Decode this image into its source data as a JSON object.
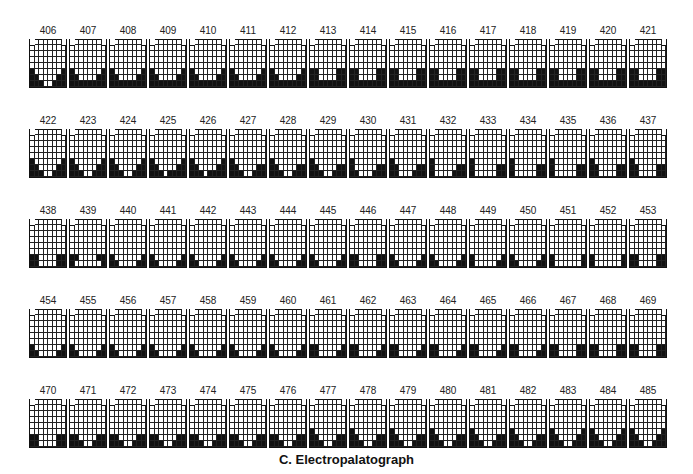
{
  "figure": {
    "caption": "C. Electropalatograph",
    "grid_shape": {
      "rows": 8,
      "cols": 8,
      "row0_cols": "1-6"
    },
    "frames": [
      {
        "id": "406",
        "p": [
          "000000",
          "00000000",
          "00000000",
          "00000000",
          "00000000",
          "10000001",
          "11000011",
          "11100111"
        ]
      },
      {
        "id": "407",
        "p": [
          "000000",
          "00000000",
          "00000000",
          "00000000",
          "00000000",
          "10000001",
          "11000011",
          "11111111"
        ]
      },
      {
        "id": "408",
        "p": [
          "000000",
          "00000000",
          "00000000",
          "00000000",
          "00000000",
          "10000001",
          "11000011",
          "11111111"
        ]
      },
      {
        "id": "409",
        "p": [
          "000000",
          "00000000",
          "00000000",
          "00000000",
          "00000000",
          "10000001",
          "11000011",
          "11111111"
        ]
      },
      {
        "id": "410",
        "p": [
          "000000",
          "00000000",
          "00000000",
          "00000000",
          "00000000",
          "10000001",
          "11000011",
          "11111111"
        ]
      },
      {
        "id": "411",
        "p": [
          "000000",
          "00000000",
          "00000000",
          "00000000",
          "00000000",
          "10000001",
          "11000011",
          "11111111"
        ]
      },
      {
        "id": "412",
        "p": [
          "000000",
          "00000000",
          "00000000",
          "00000000",
          "00000000",
          "10000001",
          "11000011",
          "11111111"
        ]
      },
      {
        "id": "413",
        "p": [
          "000000",
          "00000000",
          "00000000",
          "00000000",
          "00000000",
          "11000011",
          "11000011",
          "11111111"
        ]
      },
      {
        "id": "414",
        "p": [
          "000000",
          "00000000",
          "00000000",
          "00000000",
          "00000000",
          "11000011",
          "11000011",
          "11111111"
        ]
      },
      {
        "id": "415",
        "p": [
          "000000",
          "00000000",
          "00000000",
          "00000000",
          "00000000",
          "11000011",
          "11000011",
          "11111111"
        ]
      },
      {
        "id": "416",
        "p": [
          "000000",
          "00000000",
          "00000000",
          "00000000",
          "00000000",
          "11000011",
          "11000011",
          "11111111"
        ]
      },
      {
        "id": "417",
        "p": [
          "000000",
          "00000000",
          "00000000",
          "00000000",
          "00000000",
          "11000011",
          "11000011",
          "11111111"
        ]
      },
      {
        "id": "418",
        "p": [
          "000000",
          "00000000",
          "00000000",
          "00000000",
          "00000000",
          "11000011",
          "11000011",
          "11111111"
        ]
      },
      {
        "id": "419",
        "p": [
          "000000",
          "00000000",
          "00000000",
          "00000000",
          "00000000",
          "11000011",
          "11000011",
          "11111111"
        ]
      },
      {
        "id": "420",
        "p": [
          "000000",
          "00000000",
          "00000000",
          "00000000",
          "00000000",
          "11000011",
          "11000011",
          "11111111"
        ]
      },
      {
        "id": "421",
        "p": [
          "000000",
          "00000000",
          "00000000",
          "00000000",
          "00000000",
          "11000011",
          "11000011",
          "11111111"
        ]
      },
      {
        "id": "422",
        "p": [
          "000000",
          "00000000",
          "00000000",
          "00000000",
          "00000000",
          "10000001",
          "11000011",
          "11100111"
        ]
      },
      {
        "id": "423",
        "p": [
          "000000",
          "00000000",
          "00000000",
          "00000000",
          "00000000",
          "10000001",
          "11000011",
          "11100111"
        ]
      },
      {
        "id": "424",
        "p": [
          "000000",
          "00000000",
          "00000000",
          "00000000",
          "00000000",
          "10000001",
          "11000011",
          "11100111"
        ]
      },
      {
        "id": "425",
        "p": [
          "000000",
          "00000000",
          "00000000",
          "00000000",
          "00000000",
          "10000001",
          "11000011",
          "11101111"
        ]
      },
      {
        "id": "426",
        "p": [
          "000000",
          "00000000",
          "00000000",
          "00000000",
          "00000000",
          "10000001",
          "11000011",
          "11101111"
        ]
      },
      {
        "id": "427",
        "p": [
          "000000",
          "00000000",
          "00000000",
          "00000000",
          "00000000",
          "10000000",
          "11000011",
          "11100111"
        ]
      },
      {
        "id": "428",
        "p": [
          "000000",
          "00000000",
          "00000000",
          "00000000",
          "00000000",
          "10000000",
          "11000011",
          "11100111"
        ]
      },
      {
        "id": "429",
        "p": [
          "000000",
          "00000000",
          "00000000",
          "00000000",
          "00000000",
          "10000000",
          "11000011",
          "11100111"
        ]
      },
      {
        "id": "430",
        "p": [
          "000000",
          "00000000",
          "00000000",
          "00000000",
          "00000000",
          "10000000",
          "10000011",
          "11000111"
        ]
      },
      {
        "id": "431",
        "p": [
          "000000",
          "00000000",
          "00000000",
          "00000000",
          "00000000",
          "10000000",
          "11000011",
          "11000111"
        ]
      },
      {
        "id": "432",
        "p": [
          "000000",
          "00000000",
          "00000000",
          "00000000",
          "00000000",
          "10000000",
          "10000011",
          "10000111"
        ]
      },
      {
        "id": "433",
        "p": [
          "000000",
          "00000000",
          "00000000",
          "00000000",
          "00000000",
          "10000000",
          "10000011",
          "10000011"
        ]
      },
      {
        "id": "434",
        "p": [
          "000000",
          "00000000",
          "00000000",
          "00000000",
          "00000000",
          "10000000",
          "10000011",
          "10000011"
        ]
      },
      {
        "id": "435",
        "p": [
          "000000",
          "00000000",
          "00000000",
          "00000000",
          "00000000",
          "10000000",
          "10000011",
          "10000011"
        ]
      },
      {
        "id": "436",
        "p": [
          "000000",
          "00000000",
          "00000000",
          "00000000",
          "00000000",
          "10000000",
          "11000011",
          "11000011"
        ]
      },
      {
        "id": "437",
        "p": [
          "000000",
          "00000000",
          "00000000",
          "00000000",
          "00000000",
          "10000000",
          "11000011",
          "11000011"
        ]
      },
      {
        "id": "438",
        "p": [
          "000000",
          "00000000",
          "00000000",
          "00000000",
          "00000000",
          "00000000",
          "11000011",
          "11000011"
        ]
      },
      {
        "id": "439",
        "p": [
          "000000",
          "00000000",
          "00000000",
          "00000000",
          "00000000",
          "00000000",
          "11000011",
          "10000001"
        ]
      },
      {
        "id": "440",
        "p": [
          "000000",
          "00000000",
          "00000000",
          "00000000",
          "00000000",
          "00000000",
          "10000001",
          "11000011"
        ]
      },
      {
        "id": "441",
        "p": [
          "000000",
          "00000000",
          "00000000",
          "00000000",
          "00000000",
          "00000000",
          "10000001",
          "11000011"
        ]
      },
      {
        "id": "442",
        "p": [
          "000000",
          "00000000",
          "00000000",
          "00000000",
          "00000000",
          "00000000",
          "10000001",
          "11000011"
        ]
      },
      {
        "id": "443",
        "p": [
          "000000",
          "00000000",
          "00000000",
          "00000000",
          "00000000",
          "00000000",
          "10000001",
          "11000011"
        ]
      },
      {
        "id": "444",
        "p": [
          "000000",
          "00000000",
          "00000000",
          "00000000",
          "00000000",
          "00000000",
          "10000001",
          "11000011"
        ]
      },
      {
        "id": "445",
        "p": [
          "000000",
          "00000000",
          "00000000",
          "00000000",
          "00000000",
          "00000000",
          "10000001",
          "11000011"
        ]
      },
      {
        "id": "446",
        "p": [
          "000000",
          "00000000",
          "00000000",
          "00000000",
          "00000000",
          "00000000",
          "11000011",
          "11000011"
        ]
      },
      {
        "id": "447",
        "p": [
          "000000",
          "00000000",
          "00000000",
          "00000000",
          "00000000",
          "00000000",
          "10000001",
          "11000011"
        ]
      },
      {
        "id": "448",
        "p": [
          "000000",
          "00000000",
          "00000000",
          "00000000",
          "00000000",
          "00000000",
          "10000001",
          "11000011"
        ]
      },
      {
        "id": "449",
        "p": [
          "000000",
          "00000000",
          "00000000",
          "00000000",
          "00000000",
          "00000000",
          "10000001",
          "10000011"
        ]
      },
      {
        "id": "450",
        "p": [
          "000000",
          "00000000",
          "00000000",
          "00000000",
          "00000000",
          "00000000",
          "10000001",
          "11000011"
        ]
      },
      {
        "id": "451",
        "p": [
          "000000",
          "00000000",
          "00000000",
          "00000000",
          "00000000",
          "00000000",
          "10000001",
          "10000001"
        ]
      },
      {
        "id": "452",
        "p": [
          "000000",
          "00000000",
          "00000000",
          "00000000",
          "00000000",
          "00000000",
          "10000001",
          "10000001"
        ]
      },
      {
        "id": "453",
        "p": [
          "000000",
          "00000000",
          "00000000",
          "00000000",
          "00000000",
          "00000000",
          "11000011",
          "11000011"
        ]
      },
      {
        "id": "454",
        "p": [
          "000000",
          "00000000",
          "00000000",
          "00000000",
          "00000000",
          "00000000",
          "10000001",
          "11000011"
        ]
      },
      {
        "id": "455",
        "p": [
          "000000",
          "00000000",
          "00000000",
          "00000000",
          "00000000",
          "00000000",
          "10000001",
          "11000011"
        ]
      },
      {
        "id": "456",
        "p": [
          "000000",
          "00000000",
          "00000000",
          "00000000",
          "00000000",
          "00000000",
          "10000001",
          "11000011"
        ]
      },
      {
        "id": "457",
        "p": [
          "000000",
          "00000000",
          "00000000",
          "00000000",
          "00000000",
          "00000000",
          "10000001",
          "11000011"
        ]
      },
      {
        "id": "458",
        "p": [
          "000000",
          "00000000",
          "00000000",
          "00000000",
          "00000000",
          "00000000",
          "10000001",
          "11000011"
        ]
      },
      {
        "id": "459",
        "p": [
          "000000",
          "00000000",
          "00000000",
          "00000000",
          "00000000",
          "00000000",
          "10000001",
          "11000011"
        ]
      },
      {
        "id": "460",
        "p": [
          "000000",
          "00000000",
          "00000000",
          "00000000",
          "00000000",
          "00000000",
          "10000001",
          "11000011"
        ]
      },
      {
        "id": "461",
        "p": [
          "000000",
          "00000000",
          "00000000",
          "00000000",
          "00000000",
          "00000000",
          "11000001",
          "11000011"
        ]
      },
      {
        "id": "462",
        "p": [
          "000000",
          "00000000",
          "00000000",
          "00000000",
          "00000000",
          "00000000",
          "11000001",
          "11000011"
        ]
      },
      {
        "id": "463",
        "p": [
          "000000",
          "00000000",
          "00000000",
          "00000000",
          "00000000",
          "00000000",
          "11000001",
          "11000011"
        ]
      },
      {
        "id": "464",
        "p": [
          "000000",
          "00000000",
          "00000000",
          "00000000",
          "00000000",
          "00000000",
          "11000001",
          "11000011"
        ]
      },
      {
        "id": "465",
        "p": [
          "000000",
          "00000000",
          "00000000",
          "00000000",
          "00000000",
          "00000000",
          "11000001",
          "11000011"
        ]
      },
      {
        "id": "466",
        "p": [
          "000000",
          "00000000",
          "00000000",
          "00000000",
          "00000000",
          "00000000",
          "11000001",
          "11000011"
        ]
      },
      {
        "id": "467",
        "p": [
          "000000",
          "00000000",
          "00000000",
          "00000000",
          "00000000",
          "00000000",
          "11000011",
          "11000011"
        ]
      },
      {
        "id": "468",
        "p": [
          "000000",
          "00000000",
          "00000000",
          "00000000",
          "00000000",
          "00000000",
          "11000011",
          "11000011"
        ]
      },
      {
        "id": "469",
        "p": [
          "000000",
          "00000000",
          "00000000",
          "00000000",
          "00000000",
          "00000000",
          "11000011",
          "11000011"
        ]
      },
      {
        "id": "470",
        "p": [
          "000000",
          "00000000",
          "00000000",
          "00000000",
          "00000000",
          "00000000",
          "11000011",
          "11000011"
        ]
      },
      {
        "id": "471",
        "p": [
          "000000",
          "00000000",
          "00000000",
          "00000000",
          "00000000",
          "00000000",
          "11000011",
          "11100111"
        ]
      },
      {
        "id": "472",
        "p": [
          "000000",
          "00000000",
          "00000000",
          "00000000",
          "00000000",
          "00000000",
          "11000011",
          "11100111"
        ]
      },
      {
        "id": "473",
        "p": [
          "000000",
          "00000000",
          "00000000",
          "00000000",
          "00000000",
          "00000000",
          "11000011",
          "11100111"
        ]
      },
      {
        "id": "474",
        "p": [
          "000000",
          "00000000",
          "00000000",
          "00000000",
          "00000000",
          "00000000",
          "11000011",
          "11100111"
        ]
      },
      {
        "id": "475",
        "p": [
          "000000",
          "00000000",
          "00000000",
          "00000000",
          "00000000",
          "00000000",
          "11000011",
          "11100111"
        ]
      },
      {
        "id": "476",
        "p": [
          "000000",
          "00000000",
          "00000000",
          "00000000",
          "00000000",
          "00000000",
          "11000011",
          "11100111"
        ]
      },
      {
        "id": "477",
        "p": [
          "000000",
          "00000000",
          "00000000",
          "00000000",
          "00000000",
          "10000000",
          "11000011",
          "11100111"
        ]
      },
      {
        "id": "478",
        "p": [
          "000000",
          "00000000",
          "00000000",
          "00000000",
          "00000000",
          "10000000",
          "11000011",
          "11100111"
        ]
      },
      {
        "id": "479",
        "p": [
          "000000",
          "00000000",
          "00000000",
          "00000000",
          "00000000",
          "10000000",
          "11000011",
          "11100111"
        ]
      },
      {
        "id": "480",
        "p": [
          "000000",
          "00000000",
          "00000000",
          "00000000",
          "00000000",
          "10000000",
          "11000011",
          "11100111"
        ]
      },
      {
        "id": "481",
        "p": [
          "000000",
          "00000000",
          "00000000",
          "00000000",
          "00000000",
          "10000000",
          "11000011",
          "11100111"
        ]
      },
      {
        "id": "482",
        "p": [
          "000000",
          "00000000",
          "00000000",
          "00000000",
          "00000000",
          "10000000",
          "11000011",
          "11100111"
        ]
      },
      {
        "id": "483",
        "p": [
          "000000",
          "00000000",
          "00000000",
          "00000000",
          "00000000",
          "10000001",
          "11000011",
          "11100111"
        ]
      },
      {
        "id": "484",
        "p": [
          "000000",
          "00000000",
          "00000000",
          "00000000",
          "00000000",
          "10000001",
          "11000011",
          "11100111"
        ]
      },
      {
        "id": "485",
        "p": [
          "000000",
          "00000000",
          "00000000",
          "00000000",
          "00000000",
          "10000001",
          "11000011",
          "11100111"
        ]
      }
    ]
  }
}
